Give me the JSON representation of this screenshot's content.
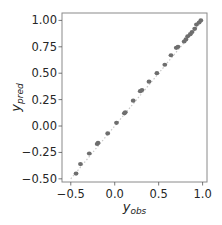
{
  "chart_data": {
    "type": "scatter",
    "title": "",
    "xlabel": "y",
    "xlabel_sub": "obs",
    "ylabel": "y",
    "ylabel_sub": "pred",
    "xlim": [
      -0.6,
      1.05
    ],
    "ylim": [
      -0.53,
      1.07
    ],
    "xticks": [
      -0.5,
      0.0,
      0.5,
      1.0
    ],
    "xtick_labels": [
      "−0.5",
      "0.0",
      "0.5",
      "1.0"
    ],
    "yticks": [
      -0.5,
      -0.25,
      0.0,
      0.25,
      0.5,
      0.75,
      1.0
    ],
    "ytick_labels": [
      "−0.50",
      "−0.25",
      "0.00",
      "0.25",
      "0.50",
      "0.75",
      "1.00"
    ],
    "grid": false,
    "legend": "none",
    "reference_line": {
      "from": [
        -0.5,
        -0.5
      ],
      "to": [
        1.0,
        1.0
      ],
      "style": "dotted",
      "color": "#c8c8c8"
    },
    "point_color": "#6e6e6e",
    "series": [
      {
        "name": "predictions",
        "x": [
          -0.44,
          -0.39,
          -0.29,
          -0.2,
          -0.19,
          -0.08,
          0.02,
          0.11,
          0.12,
          0.21,
          0.29,
          0.31,
          0.39,
          0.48,
          0.57,
          0.64,
          0.7,
          0.72,
          0.79,
          0.81,
          0.83,
          0.86,
          0.88,
          0.91,
          0.93,
          0.96,
          0.98
        ],
        "y": [
          -0.45,
          -0.36,
          -0.26,
          -0.17,
          -0.16,
          -0.07,
          0.03,
          0.12,
          0.13,
          0.24,
          0.33,
          0.34,
          0.42,
          0.5,
          0.58,
          0.67,
          0.74,
          0.75,
          0.8,
          0.82,
          0.85,
          0.87,
          0.89,
          0.92,
          0.96,
          0.98,
          1.0
        ]
      }
    ]
  }
}
